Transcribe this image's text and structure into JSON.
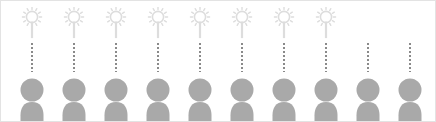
{
  "figure": {
    "width": 436,
    "height": 122,
    "background_color": "#ffffff",
    "border_color": "#e3e3e3"
  },
  "palette": {
    "person_gray": "#a9a9a9",
    "idea_gray": "#dddddd",
    "dotted_gray": "#8a8a8a"
  },
  "layout": {
    "column_count": 10,
    "column_spacing": 42,
    "first_column_center_x": 31,
    "idea_row_top": 6,
    "dotted_row_top": 42,
    "person_row_top": 76
  },
  "icons": {
    "idea": "idea-bulb-icon",
    "connector": "dotted-connector-icon",
    "person": "person-icon"
  },
  "columns": [
    {
      "index": 1,
      "has_idea": true,
      "has_connector": true,
      "has_person": true
    },
    {
      "index": 2,
      "has_idea": true,
      "has_connector": true,
      "has_person": true
    },
    {
      "index": 3,
      "has_idea": true,
      "has_connector": true,
      "has_person": true
    },
    {
      "index": 4,
      "has_idea": true,
      "has_connector": true,
      "has_person": true
    },
    {
      "index": 5,
      "has_idea": true,
      "has_connector": true,
      "has_person": true
    },
    {
      "index": 6,
      "has_idea": true,
      "has_connector": true,
      "has_person": true
    },
    {
      "index": 7,
      "has_idea": true,
      "has_connector": true,
      "has_person": true
    },
    {
      "index": 8,
      "has_idea": true,
      "has_connector": true,
      "has_person": true
    },
    {
      "index": 9,
      "has_idea": false,
      "has_connector": true,
      "has_person": true
    },
    {
      "index": 10,
      "has_idea": false,
      "has_connector": true,
      "has_person": true
    }
  ],
  "counts": {
    "people": 10,
    "ideas": 8,
    "connectors": 10
  }
}
